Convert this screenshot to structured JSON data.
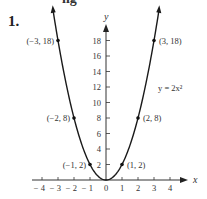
{
  "header": {
    "problem_number": "1.",
    "top_cutoff_text": "ng   "
  },
  "chart_data": {
    "type": "line",
    "title": "",
    "equation_label": "y = 2x²",
    "xlabel": "x",
    "ylabel": "y",
    "xlim": [
      -4.5,
      4.5
    ],
    "ylim": [
      0,
      20
    ],
    "x_ticks": [
      "-4",
      "-3",
      "-2",
      "-1",
      "0",
      "1",
      "2",
      "3",
      "4"
    ],
    "y_ticks": [
      "2",
      "4",
      "6",
      "8",
      "10",
      "12",
      "14",
      "16",
      "18"
    ],
    "grid": false,
    "series": [
      {
        "name": "y = 2x²",
        "x": [
          -3,
          -2,
          -1,
          0,
          1,
          2,
          3
        ],
        "y": [
          18,
          8,
          2,
          0,
          2,
          8,
          18
        ]
      }
    ],
    "labeled_points": [
      {
        "label": "(−3, 18)",
        "x": -3,
        "y": 18
      },
      {
        "label": "(−2, 8)",
        "x": -2,
        "y": 8
      },
      {
        "label": "(−1, 2)",
        "x": -1,
        "y": 2
      },
      {
        "label": "(1, 2)",
        "x": 1,
        "y": 2
      },
      {
        "label": "(2, 8)",
        "x": 2,
        "y": 8
      },
      {
        "label": "(3, 18)",
        "x": 3,
        "y": 18
      }
    ]
  }
}
